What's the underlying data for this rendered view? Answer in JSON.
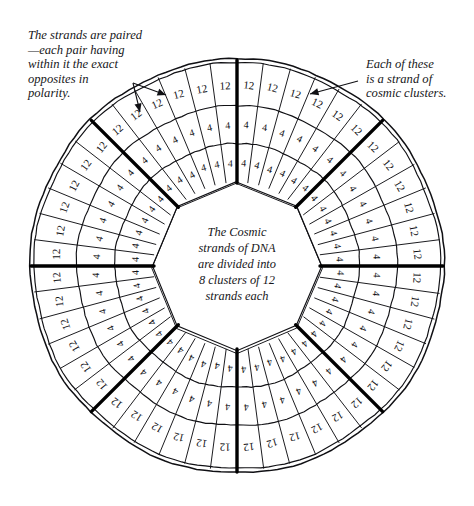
{
  "diagram": {
    "center_text": {
      "lines": [
        "The Cosmic",
        "strands of DNA",
        "are divided into",
        "8 clusters of 12",
        "strands each"
      ]
    },
    "annotations": [
      {
        "id": "strands-paired",
        "text": "The strands are paired\n—each pair having\nwithin it the exact\nopposites in\npolarity.",
        "position": "top-left",
        "arrows": 2
      },
      {
        "id": "strand-of-clusters",
        "text": "Each of these\nis a strand of\ncosmic clusters.",
        "position": "top-right",
        "arrows": 1
      }
    ],
    "structure": {
      "clusters": 8,
      "cluster_divider_angles_deg": [
        0,
        45,
        90,
        135,
        180,
        225,
        270,
        315
      ],
      "rings": [
        {
          "name": "outer",
          "label": "12",
          "cells": 48,
          "r_inner": 160,
          "r_outer": 203
        },
        {
          "name": "middle",
          "label": "4",
          "cells": 48,
          "r_inner": 122,
          "r_outer": 160
        },
        {
          "name": "inner",
          "label": "4",
          "cells": 48,
          "r_inner": 84,
          "r_outer": 122
        }
      ],
      "hole": {
        "shape": "octagon",
        "radius": 84
      },
      "center": {
        "x": 237,
        "y": 266
      },
      "outer_rim_radius": 207
    },
    "colors": {
      "ink": "#101014",
      "paper": "#ffffff",
      "divider": "#000000"
    }
  },
  "chart_data": {
    "type": "pie",
    "categories": [
      "Cluster 1",
      "Cluster 2",
      "Cluster 3",
      "Cluster 4",
      "Cluster 5",
      "Cluster 6",
      "Cluster 7",
      "Cluster 8"
    ],
    "values": [
      12,
      12,
      12,
      12,
      12,
      12,
      12,
      12
    ],
    "series": [
      {
        "name": "outer ring (strands)",
        "cell_label": "12",
        "cells_per_cluster": 6,
        "values": [
          12,
          12,
          12,
          12,
          12,
          12,
          12,
          12
        ]
      },
      {
        "name": "middle ring",
        "cell_label": "4",
        "cells_per_cluster": 6,
        "values": [
          4,
          4,
          4,
          4,
          4,
          4,
          4,
          4
        ]
      },
      {
        "name": "inner ring",
        "cell_label": "4",
        "cells_per_cluster": 6,
        "values": [
          4,
          4,
          4,
          4,
          4,
          4,
          4,
          4
        ]
      }
    ],
    "legend": "none",
    "grid": false,
    "xlabel": "",
    "ylabel": ""
  }
}
